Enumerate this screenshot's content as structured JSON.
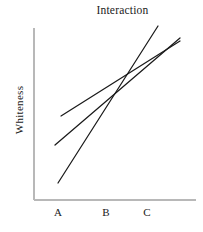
{
  "chart_data": {
    "type": "line",
    "title": "Interaction",
    "xlabel": "",
    "ylabel": "Whiteness",
    "categories": [
      "A",
      "B",
      "C"
    ],
    "grid": false,
    "legend": false,
    "axis_color": "#b8b8b8",
    "line_color": "#1a1a1a",
    "xlim": [
      0,
      3
    ],
    "ylim": [
      0,
      10
    ],
    "series": [
      {
        "name": "series-1",
        "note": "steep rising line, lowest at A, highest at C",
        "values": [
          1.2,
          5.2,
          9.6
        ]
      },
      {
        "name": "series-2",
        "note": "moderate rising line, middle at A, high at C",
        "values": [
          3.6,
          5.6,
          8.6
        ]
      },
      {
        "name": "series-3",
        "note": "shallow rising line, highest at A, high at C",
        "values": [
          5.3,
          6.7,
          8.5
        ]
      }
    ]
  },
  "axes": {
    "y_label": "Whiteness",
    "tick_labels": [
      {
        "text": "A",
        "x": 58
      },
      {
        "text": "B",
        "x": 106
      },
      {
        "text": "C",
        "x": 147
      }
    ]
  },
  "geometry": {
    "lines": [
      {
        "name": "line-steep",
        "x1": 58,
        "y1": 183,
        "x2": 158,
        "y2": 26
      },
      {
        "name": "line-middle",
        "x1": 55,
        "y1": 145,
        "x2": 180,
        "y2": 38
      },
      {
        "name": "line-shallow",
        "x1": 61,
        "y1": 116,
        "x2": 180,
        "y2": 41
      }
    ],
    "x_axis": {
      "x1": 34,
      "y1": 200,
      "x2": 196,
      "y2": 200
    },
    "y_axis": {
      "x1": 34,
      "y1": 28,
      "x2": 34,
      "y2": 200
    }
  }
}
